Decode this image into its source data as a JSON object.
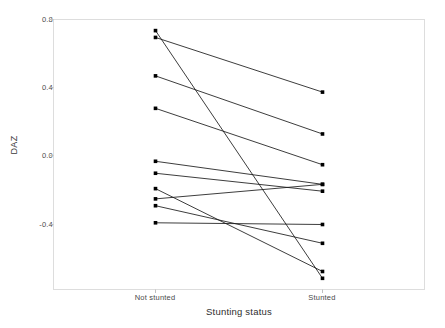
{
  "chart_data": {
    "type": "line",
    "title": "",
    "xlabel": "Stunting status",
    "ylabel": "DAZ",
    "categories": [
      "Not stunted",
      "Stunted"
    ],
    "x_tick_labels": [
      "Not stunted",
      "Stunted"
    ],
    "y_tick_labels": [
      "0.8",
      "0.4",
      "0.0",
      "-0.4"
    ],
    "y_ticks": [
      0.8,
      0.4,
      0.0,
      -0.4
    ],
    "ylim": [
      -0.78,
      0.8
    ],
    "grid": false,
    "legend": "none",
    "series": [
      {
        "name": "pair-1",
        "values": [
          0.735,
          -0.715
        ]
      },
      {
        "name": "pair-2",
        "values": [
          0.695,
          0.375
        ]
      },
      {
        "name": "pair-3",
        "values": [
          0.47,
          0.13
        ]
      },
      {
        "name": "pair-4",
        "values": [
          0.28,
          -0.05
        ]
      },
      {
        "name": "pair-5",
        "values": [
          -0.03,
          -0.165
        ]
      },
      {
        "name": "pair-6",
        "values": [
          -0.1,
          -0.205
        ]
      },
      {
        "name": "pair-7",
        "values": [
          -0.19,
          -0.675
        ]
      },
      {
        "name": "pair-8",
        "values": [
          -0.25,
          -0.165
        ]
      },
      {
        "name": "pair-9",
        "values": [
          -0.29,
          -0.51
        ]
      },
      {
        "name": "pair-10",
        "values": [
          -0.39,
          -0.4
        ]
      }
    ]
  },
  "style": {
    "panel_border": "#d9d9d9",
    "axis_line": "#cccccc",
    "line_color": "#1a1a1a",
    "point_color": "#000000",
    "background": "#ffffff",
    "tick_text": "#4a4a4a",
    "label_text": "#2e2e2e"
  }
}
